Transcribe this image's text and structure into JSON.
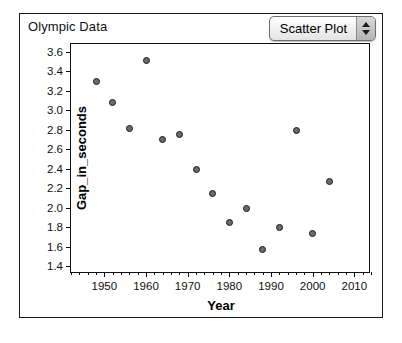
{
  "window": {
    "title": "Olympic Data"
  },
  "controls": {
    "plot_type": {
      "name": "plot-type-popup",
      "value": "Scatter Plot",
      "stepper_up_icon": "triangle-up-icon",
      "stepper_down_icon": "triangle-down-icon"
    }
  },
  "colors": {
    "point_fill": "#6b6b6b",
    "point_stroke": "#1b1b1b",
    "axis": "#111111",
    "panel_border": "#1a1a1a",
    "background": "#ffffff"
  },
  "chart_data": {
    "type": "scatter",
    "title": "Olympic Data",
    "xlabel": "Year",
    "ylabel": "Gap_in_seconds",
    "xlim": [
      1942,
      2014
    ],
    "ylim": [
      1.32,
      3.68
    ],
    "xticks": [
      1950,
      1960,
      1970,
      1980,
      1990,
      2000,
      2010
    ],
    "yticks": [
      1.4,
      1.6,
      1.8,
      2.0,
      2.2,
      2.4,
      2.6,
      2.8,
      3.0,
      3.2,
      3.4,
      3.6
    ],
    "xminor_step": 2,
    "grid": false,
    "legend": false,
    "points": [
      {
        "x": 1948,
        "y": 3.3
      },
      {
        "x": 1952,
        "y": 3.08
      },
      {
        "x": 1956,
        "y": 2.81
      },
      {
        "x": 1960,
        "y": 3.51
      },
      {
        "x": 1964,
        "y": 2.7
      },
      {
        "x": 1968,
        "y": 2.75
      },
      {
        "x": 1972,
        "y": 2.39
      },
      {
        "x": 1976,
        "y": 2.15
      },
      {
        "x": 1980,
        "y": 1.85
      },
      {
        "x": 1984,
        "y": 1.99
      },
      {
        "x": 1988,
        "y": 1.57
      },
      {
        "x": 1992,
        "y": 1.8
      },
      {
        "x": 1996,
        "y": 2.79
      },
      {
        "x": 2000,
        "y": 1.74
      },
      {
        "x": 2004,
        "y": 2.27
      }
    ]
  }
}
